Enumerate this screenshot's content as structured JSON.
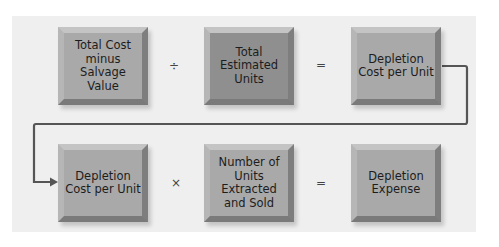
{
  "diagram": {
    "row1": {
      "box1": "Total Cost minus Salvage Value",
      "op1": "÷",
      "box2": "Total Estimated Units",
      "op2": "=",
      "box3": "Depletion Cost per Unit"
    },
    "row2": {
      "box1": "Depletion Cost per Unit",
      "op1": "×",
      "box2": "Number of Units Extracted and Sold",
      "op2": "=",
      "box3": "Depletion Expense"
    },
    "colors": {
      "panel": "#efefef",
      "box_light": "#a9a9a9",
      "box_dark": "#8f8f8f",
      "connector": "#555555"
    }
  }
}
